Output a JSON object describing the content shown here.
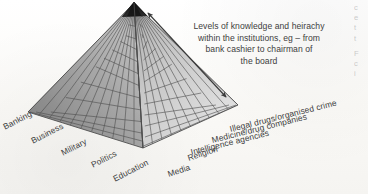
{
  "diagram": {
    "title_text": "Levels of knowledge and heirachy within the institutions, eg – from bank cashier to chairman of the board",
    "caption_lines": [
      "Levels of knowledge and heirachy",
      "within the institutions, eg – from",
      "bank cashier to chairman of",
      "the board"
    ],
    "apex_color": "#1b1b1b",
    "left_face_color": "#8d8d8d",
    "right_face_color": "#c9c9c9",
    "grid_line_color": "#4a4a4a",
    "arrow_color": "#3a3a3a",
    "arrow_name": "levels-of-knowledge-arrow"
  },
  "base_labels": {
    "left_side": [
      {
        "id": "banking",
        "text": "Banking"
      },
      {
        "id": "business",
        "text": "Business"
      },
      {
        "id": "military",
        "text": "Military"
      },
      {
        "id": "politics",
        "text": "Politics"
      },
      {
        "id": "education",
        "text": "Education"
      }
    ],
    "right_side": [
      {
        "id": "media",
        "text": "Media"
      },
      {
        "id": "religion",
        "text": "Religion"
      },
      {
        "id": "intelligence",
        "text": "Intelligence agencies"
      },
      {
        "id": "medicine",
        "text": "Medicine/drug companies"
      },
      {
        "id": "illegal",
        "text": "Illegal drugs/organised crime"
      }
    ]
  },
  "margin_text": {
    "lines_top": [
      "c",
      "e",
      "t",
      "t"
    ],
    "lines_bottom": [
      "F",
      "c",
      "i"
    ]
  }
}
